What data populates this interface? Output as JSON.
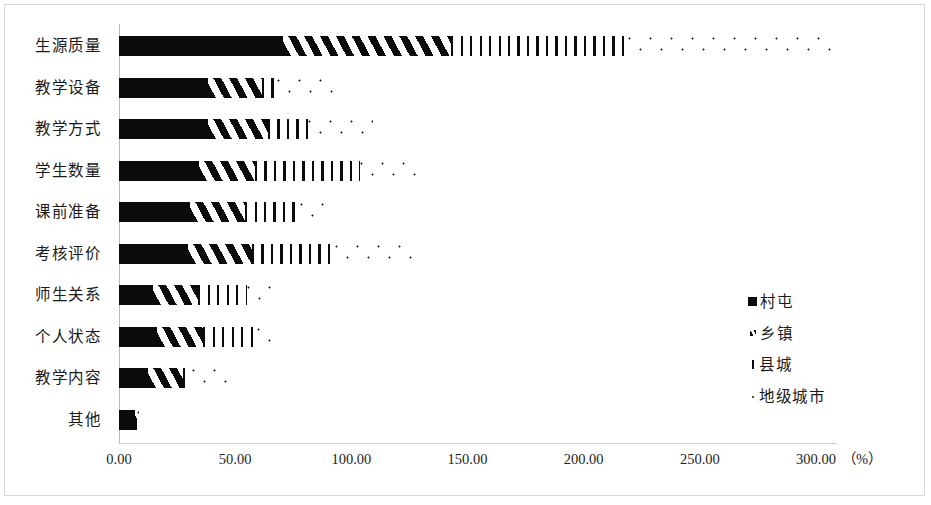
{
  "chart_data": {
    "type": "bar",
    "orientation": "horizontal",
    "stacked": true,
    "title": "",
    "xlabel": "",
    "ylabel": "",
    "unit_label": "（%）",
    "xlim": [
      0,
      300
    ],
    "grid": false,
    "legend_position": "middle-right",
    "categories": [
      "生源质量",
      "教学设备",
      "教学方式",
      "学生数量",
      "课前准备",
      "考核评价",
      "师生关系",
      "个人状态",
      "教学内容",
      "其他"
    ],
    "xticks": [
      "0.00",
      "50.00",
      "100.00",
      "150.00",
      "200.00",
      "250.00",
      "300.00"
    ],
    "xtick_values": [
      0,
      50,
      100,
      150,
      200,
      250,
      300
    ],
    "series": [
      {
        "name": "村屯",
        "pattern": "solid",
        "values": [
          70.6,
          38.3,
          38.3,
          34.4,
          30.6,
          29.7,
          14.6,
          16.4,
          12.5,
          6.9
        ]
      },
      {
        "name": "乡镇",
        "pattern": "diagonal-hatch",
        "values": [
          72.3,
          23.2,
          25.8,
          24.1,
          23.7,
          27.6,
          19.4,
          19.8,
          15.1,
          0.9
        ]
      },
      {
        "name": "县城",
        "pattern": "vertical-lines",
        "values": [
          76.2,
          6.5,
          17.2,
          45.2,
          23.7,
          35.7,
          21.1,
          23.2,
          3.9,
          0.0
        ]
      },
      {
        "name": "地级城市",
        "pattern": "dots",
        "values": [
          90.4,
          27.1,
          28.0,
          27.1,
          12.9,
          33.6,
          12.9,
          8.6,
          15.1,
          0.9
        ]
      }
    ],
    "totals": [
      309.5,
      95.1,
      109.3,
      130.8,
      90.9,
      126.6,
      68.0,
      68.0,
      46.6,
      8.7
    ]
  },
  "legend": {
    "items": [
      {
        "label": "村屯"
      },
      {
        "label": "乡镇"
      },
      {
        "label": "县城"
      },
      {
        "label": "地级城市"
      }
    ]
  },
  "colors": {
    "ink": "#0b0b0b",
    "axis": "#c4c4c4",
    "background": "#ffffff"
  }
}
